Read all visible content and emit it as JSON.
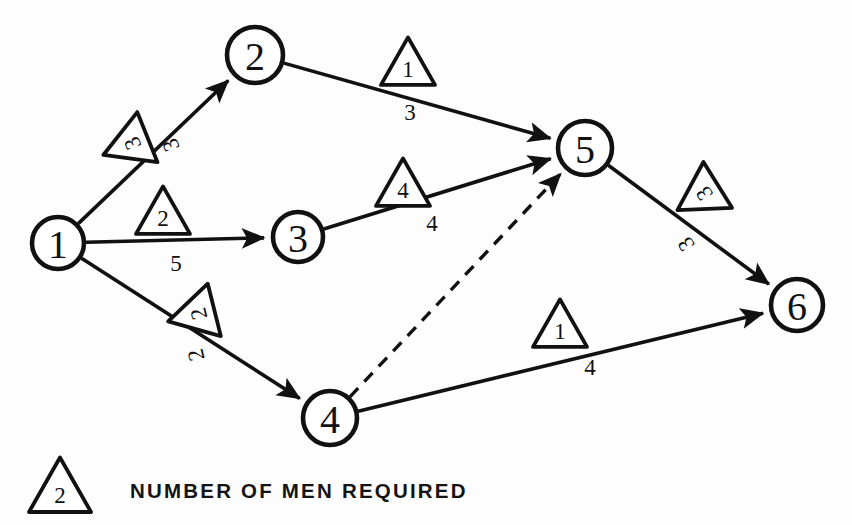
{
  "diagram": {
    "stroke_color": "#111111",
    "background_color": "#fdfdfd",
    "nodes": [
      {
        "id": "1",
        "label": "1",
        "x": 58,
        "y": 243,
        "r": 26
      },
      {
        "id": "2",
        "label": "2",
        "x": 255,
        "y": 55,
        "r": 28
      },
      {
        "id": "3",
        "label": "3",
        "x": 298,
        "y": 237,
        "r": 25
      },
      {
        "id": "4",
        "label": "4",
        "x": 330,
        "y": 418,
        "r": 27
      },
      {
        "id": "5",
        "label": "5",
        "x": 585,
        "y": 148,
        "r": 27
      },
      {
        "id": "6",
        "label": "6",
        "x": 797,
        "y": 305,
        "r": 26
      }
    ],
    "edges": [
      {
        "from": "1",
        "to": "2",
        "style": "solid",
        "men": "3",
        "duration": "3",
        "tri_x": 128,
        "tri_y": 145,
        "tri_rot": -112,
        "dur_x": 171,
        "dur_y": 145,
        "dur_rot": -112
      },
      {
        "from": "1",
        "to": "3",
        "style": "solid",
        "men": "2",
        "duration": "5",
        "tri_x": 163,
        "tri_y": 213,
        "tri_rot": 0,
        "dur_x": 176,
        "dur_y": 263,
        "dur_rot": 0
      },
      {
        "from": "1",
        "to": "4",
        "style": "solid",
        "men": "2",
        "duration": "2",
        "tri_x": 194,
        "tri_y": 315,
        "tri_rot": -104,
        "dur_x": 196,
        "dur_y": 355,
        "dur_rot": -104
      },
      {
        "from": "2",
        "to": "5",
        "style": "solid",
        "men": "1",
        "duration": "3",
        "tri_x": 408,
        "tri_y": 64,
        "tri_rot": 0,
        "dur_x": 410,
        "dur_y": 112,
        "dur_rot": 0
      },
      {
        "from": "3",
        "to": "5",
        "style": "solid",
        "men": "4",
        "duration": "4",
        "tri_x": 403,
        "tri_y": 185,
        "tri_rot": 0,
        "dur_x": 432,
        "dur_y": 223,
        "dur_rot": 0
      },
      {
        "from": "4",
        "to": "5",
        "style": "dashed",
        "men": "",
        "duration": "",
        "tri_x": 0,
        "tri_y": 0,
        "tri_rot": 0,
        "dur_x": 0,
        "dur_y": 0,
        "dur_rot": 0
      },
      {
        "from": "4",
        "to": "6",
        "style": "solid",
        "men": "1",
        "duration": "4",
        "tri_x": 560,
        "tri_y": 326,
        "tri_rot": 0,
        "dur_x": 590,
        "dur_y": 367,
        "dur_rot": 0
      },
      {
        "from": "5",
        "to": "6",
        "style": "solid",
        "men": "3",
        "duration": "3",
        "tri_x": 700,
        "tri_y": 196,
        "tri_rot": -122,
        "dur_x": 686,
        "dur_y": 244,
        "dur_rot": -122
      }
    ],
    "legend": {
      "symbol_value": "2",
      "text": "NUMBER OF MEN REQUIRED",
      "symbol_x": 60,
      "symbol_y": 488,
      "text_x": 130,
      "text_y": 490
    }
  }
}
